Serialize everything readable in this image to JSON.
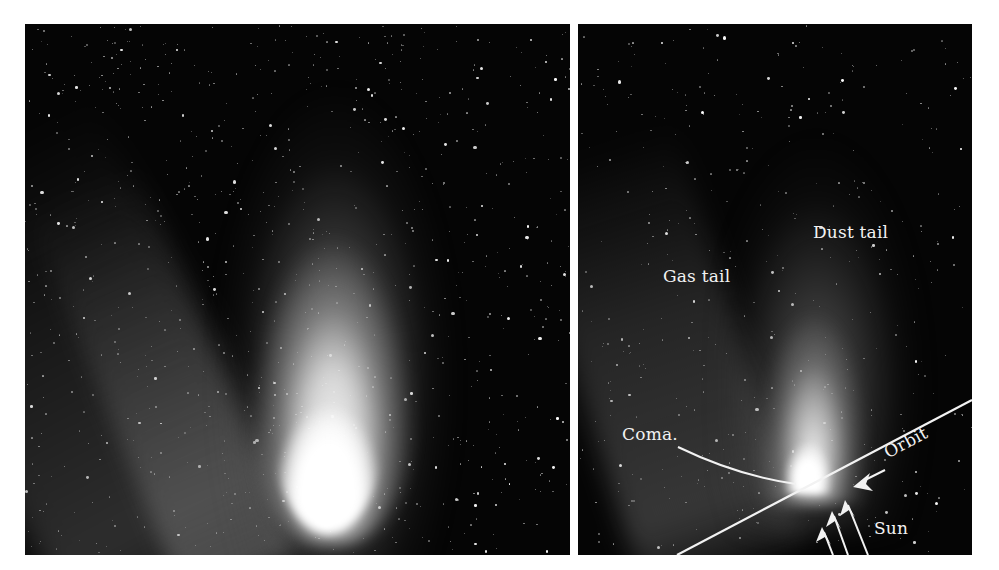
{
  "figure": {
    "background": "#ffffff",
    "panels": [
      {
        "id": "left",
        "description": "Photograph of a bright comet with a broad white dust tail and fainter bluish gas tail streaks against a star field",
        "sky_color": "#050505",
        "star_count": 900,
        "star_seed": 17
      },
      {
        "id": "right",
        "description": "Annotated photograph of a comet showing its tails, coma, orbit and direction to the Sun",
        "sky_color": "#050505",
        "star_count": 420,
        "star_seed": 91
      }
    ]
  },
  "labels": {
    "gas_tail": "Gas tail",
    "dust_tail": "Dust tail",
    "coma": "Coma.",
    "orbit": "Orbit",
    "sun": "Sun"
  },
  "annotation_color": "#f2f2f2",
  "icons": {
    "orbit_arrow": "arrow-pointing-down-left",
    "sun_arrows": "three-arrows-pointing-up-left"
  }
}
